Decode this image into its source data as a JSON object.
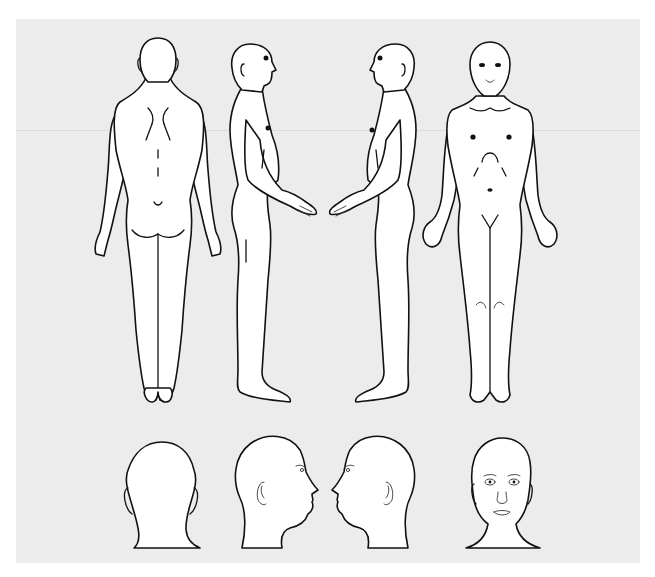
{
  "diagram": {
    "type": "body-chart",
    "background_color": "#ececec",
    "line_color": "#111111",
    "fill_color": "#ffffff",
    "full_body_views": [
      {
        "id": "posterior",
        "label": "back view"
      },
      {
        "id": "right-lateral",
        "label": "right side view (facing right)"
      },
      {
        "id": "left-lateral",
        "label": "left side view (facing left)"
      },
      {
        "id": "anterior",
        "label": "front view"
      }
    ],
    "head_views": [
      {
        "id": "head-posterior",
        "label": "head back view"
      },
      {
        "id": "head-right-lateral",
        "label": "head right profile"
      },
      {
        "id": "head-left-lateral",
        "label": "head left profile"
      },
      {
        "id": "head-anterior",
        "label": "head front view"
      }
    ]
  }
}
